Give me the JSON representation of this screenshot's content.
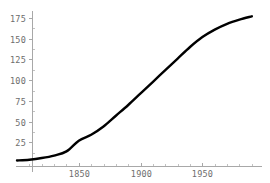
{
  "chart_data": {
    "type": "line",
    "title": "",
    "subtitle": "",
    "xlabel": "",
    "ylabel": "",
    "grid": false,
    "legend": null,
    "legend_position": "none",
    "xlim": [
      1800,
      1995
    ],
    "ylim": [
      0,
      185
    ],
    "x_ticks": [
      1850,
      1900,
      1950
    ],
    "x_tick_labels": [
      "1850",
      "1900",
      "1950"
    ],
    "x_minor_ticks": [
      1810,
      1820,
      1830,
      1840,
      1860,
      1870,
      1880,
      1890,
      1910,
      1920,
      1930,
      1940,
      1960,
      1970,
      1980,
      1990
    ],
    "y_ticks": [
      25,
      50,
      75,
      100,
      125,
      150,
      175
    ],
    "y_tick_labels": [
      "25",
      "50",
      "75",
      "100",
      "125",
      "150",
      "175"
    ],
    "y_minor_ticks": [
      12.5,
      37.5,
      62.5,
      87.5,
      112.5,
      137.5,
      162.5
    ],
    "series": [
      {
        "name": "logistic-growth",
        "color": "#000000",
        "line_width": 2.4,
        "x": [
          1800,
          1810,
          1820,
          1830,
          1840,
          1850,
          1860,
          1870,
          1880,
          1890,
          1900,
          1910,
          1920,
          1930,
          1940,
          1950,
          1960,
          1970,
          1980,
          1990
        ],
        "values": [
          3,
          4,
          6,
          9,
          14,
          27,
          34,
          44,
          57,
          70,
          84,
          98,
          112,
          126,
          140,
          152,
          161,
          168,
          173,
          177
        ]
      }
    ],
    "annotations": [],
    "axis_color": "#a8a8a8",
    "tick_label_color": "#6d6d6d",
    "background_color": "#ffffff"
  },
  "axes": {
    "y_axis_name": "value-axis",
    "x_axis_name": "year-axis"
  }
}
